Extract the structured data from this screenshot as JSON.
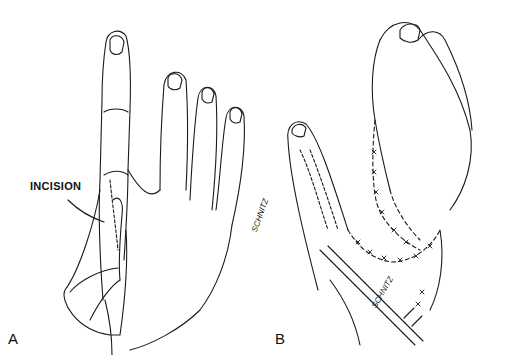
{
  "figure": {
    "panels": [
      {
        "label": "A",
        "callout": "INCISION",
        "signature": "SCHNITZ"
      },
      {
        "label": "B",
        "signature": "SCHNITZ"
      }
    ],
    "colors": {
      "line": "#1a1a1a",
      "background": "#ffffff"
    }
  }
}
